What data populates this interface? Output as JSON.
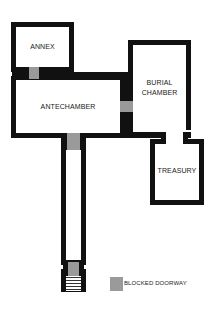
{
  "diagram": {
    "type": "floor-plan",
    "rooms": [
      {
        "id": "annex",
        "label": "ANNEX"
      },
      {
        "id": "antechamber",
        "label": "ANTECHAMBER"
      },
      {
        "id": "burial_chamber",
        "label_line1": "BURIAL",
        "label_line2": "CHAMBER"
      },
      {
        "id": "treasury",
        "label": "TREASURY"
      }
    ],
    "legend": {
      "blocked_doorway_label": "BLOCKED DOORWAY"
    },
    "colors": {
      "wall": "#111111",
      "blocked_doorway": "#9a9a9a",
      "background": "#ffffff"
    }
  }
}
